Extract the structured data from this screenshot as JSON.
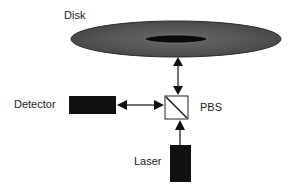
{
  "diagram": {
    "labels": {
      "disk": "Disk",
      "detector": "Detector",
      "pbs": "PBS",
      "laser": "Laser"
    },
    "components": [
      {
        "id": "disk",
        "shape": "ellipse",
        "color": "#555555"
      },
      {
        "id": "detector",
        "shape": "rectangle",
        "color": "#111111"
      },
      {
        "id": "pbs",
        "shape": "square-with-diagonal",
        "color": "#ffffff"
      },
      {
        "id": "laser",
        "shape": "rectangle",
        "color": "#111111"
      }
    ],
    "connections": [
      {
        "from": "pbs",
        "to": "disk",
        "type": "bidirectional"
      },
      {
        "from": "detector",
        "to": "pbs",
        "type": "bidirectional"
      },
      {
        "from": "laser",
        "to": "pbs",
        "type": "unidirectional"
      }
    ]
  }
}
